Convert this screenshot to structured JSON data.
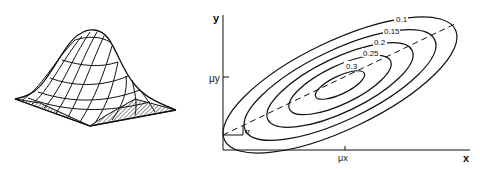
{
  "surface_plot": {
    "description": "3D bivariate normal surface (wireframe) with hatched base"
  },
  "contour_plot": {
    "x_axis_label": "x",
    "y_axis_label": "y",
    "mu_x_label": "μx",
    "mu_y_label": "μy",
    "angle_label": "σ",
    "contour_levels": [
      "0.1",
      "0.15",
      "0.2",
      "0.25",
      "0.3"
    ]
  },
  "colors": {
    "ink": "#111111",
    "background": "#ffffff"
  }
}
